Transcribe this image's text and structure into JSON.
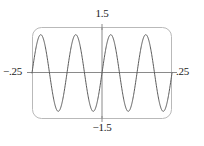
{
  "figure": {
    "kind": "graphing-calculator-plot",
    "background_color": "#ffffff",
    "frame": {
      "color": "#b9b9b9",
      "corner_radius_px": 9,
      "left_px": 32,
      "top_px": 27,
      "right_px": 172,
      "bottom_px": 119
    },
    "axis_color": "#8a8a8a",
    "curve_color": "#5a5a5a"
  },
  "labels": {
    "y_max": "1.5",
    "y_min": "−1.5",
    "x_min": "−.25",
    "x_max": ".25"
  },
  "chart_data": {
    "type": "line",
    "title": "",
    "subtitle": "",
    "xlabel": "",
    "ylabel": "",
    "grid": false,
    "legend": null,
    "legend_position": "none",
    "xlim": [
      -0.25,
      0.25
    ],
    "ylim": [
      -1.5,
      1.5
    ],
    "xticks": [
      -0.25,
      0.25
    ],
    "xticklabels": [
      "−.25",
      ".25"
    ],
    "yticks": [
      -1.5,
      1.5
    ],
    "yticklabels": [
      "−1.5",
      "1.5"
    ],
    "axes_drawn": {
      "x_axis_at_y": 0,
      "y_axis_at_x": 0
    },
    "series": [
      {
        "name": "sine wave",
        "function": "y = 1.25 * sin(2*pi*x/0.125)",
        "amplitude": 1.25,
        "period": 0.125,
        "frequency_hz": 8,
        "phase": 0,
        "cycles_visible": 4,
        "x": [
          -0.25,
          -0.2375,
          -0.225,
          -0.2125,
          -0.2,
          -0.1875,
          -0.175,
          -0.1625,
          -0.15,
          -0.1375,
          -0.125,
          -0.1125,
          -0.1,
          -0.0875,
          -0.075,
          -0.0625,
          -0.05,
          -0.0375,
          -0.025,
          -0.0125,
          0,
          0.0125,
          0.025,
          0.0375,
          0.05,
          0.0625,
          0.075,
          0.0875,
          0.1,
          0.1125,
          0.125,
          0.1375,
          0.15,
          0.1625,
          0.175,
          0.1875,
          0.2,
          0.2125,
          0.225,
          0.2375,
          0.25
        ],
        "values": [
          0,
          0.735,
          1.184,
          1.184,
          0.735,
          0,
          -0.735,
          -1.184,
          -1.184,
          -0.735,
          0,
          0.735,
          1.184,
          1.184,
          0.735,
          0,
          -0.735,
          -1.184,
          -1.184,
          -0.735,
          0,
          0.735,
          1.184,
          1.184,
          0.735,
          0,
          -0.735,
          -1.184,
          -1.184,
          -0.735,
          0,
          0.735,
          1.184,
          1.184,
          0.735,
          0,
          -0.735,
          -1.184,
          -1.184,
          -0.735,
          0
        ],
        "peaks_x": [
          -0.21875,
          -0.09375,
          0.03125,
          0.15625
        ],
        "troughs_x": [
          -0.15625,
          -0.03125,
          0.09375,
          0.21875
        ],
        "zero_crossings_x": [
          -0.25,
          -0.1875,
          -0.125,
          -0.0625,
          0,
          0.0625,
          0.125,
          0.1875,
          0.25
        ]
      }
    ]
  }
}
